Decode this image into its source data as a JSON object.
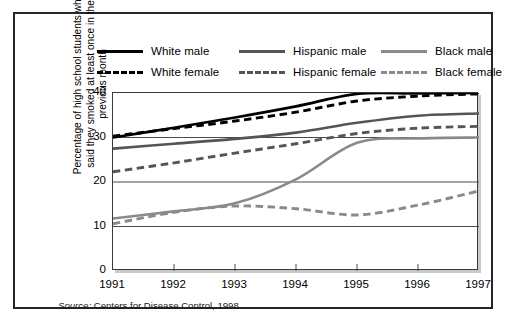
{
  "figure": {
    "source_prefix": "Source:",
    "source_text": " Centers for Disease Control, 1998."
  },
  "legend": {
    "items": [
      {
        "label": "White male",
        "style": "solid",
        "color": "#000000",
        "col": 1,
        "row": 1
      },
      {
        "label": "White female",
        "style": "dashed",
        "color": "#000000",
        "col": 1,
        "row": 2
      },
      {
        "label": "Hispanic male",
        "style": "solid",
        "color": "#555555",
        "col": 2,
        "row": 1
      },
      {
        "label": "Hispanic female",
        "style": "dashed",
        "color": "#555555",
        "col": 2,
        "row": 2
      },
      {
        "label": "Black male",
        "style": "solid",
        "color": "#8a8a8a",
        "col": 3,
        "row": 1
      },
      {
        "label": "Black female",
        "style": "dashed",
        "color": "#8a8a8a",
        "col": 3,
        "row": 2
      }
    ]
  },
  "axes": {
    "ylabel_line1": "Percentage of high school students who",
    "ylabel_line2": "said they smoked at least once in the",
    "ylabel_line3": "previous month",
    "yticks": [
      "0",
      "10",
      "20",
      "30",
      "40"
    ],
    "xticks": [
      "1991",
      "1992",
      "1993",
      "1994",
      "1995",
      "1996",
      "1997"
    ]
  },
  "chart_data": {
    "type": "line",
    "title": "",
    "xlabel": "",
    "ylabel": "Percentage of high school students who said they smoked at least once in the previous month",
    "x": [
      1991,
      1992,
      1993,
      1994,
      1995,
      1996,
      1997
    ],
    "xlim": [
      1991,
      1997
    ],
    "ylim": [
      0,
      40
    ],
    "yticks": [
      0,
      10,
      20,
      30,
      40
    ],
    "grid": "horizontal",
    "legend_position": "top",
    "series": [
      {
        "name": "White male",
        "color": "#000000",
        "style": "solid",
        "values": [
          30.0,
          32.2,
          34.5,
          37.0,
          39.8,
          39.9,
          40.0
        ]
      },
      {
        "name": "White female",
        "color": "#000000",
        "style": "dashed",
        "values": [
          30.3,
          32.0,
          33.7,
          35.7,
          38.2,
          39.3,
          39.8
        ]
      },
      {
        "name": "Hispanic male",
        "color": "#555555",
        "style": "solid",
        "values": [
          27.5,
          28.6,
          29.7,
          31.1,
          33.3,
          34.9,
          35.4
        ]
      },
      {
        "name": "Hispanic female",
        "color": "#555555",
        "style": "dashed",
        "values": [
          22.3,
          24.3,
          26.5,
          28.6,
          30.9,
          32.1,
          32.5
        ]
      },
      {
        "name": "Black male",
        "color": "#8a8a8a",
        "style": "solid",
        "values": [
          11.8,
          13.4,
          15.2,
          20.6,
          28.8,
          29.8,
          30.0
        ]
      },
      {
        "name": "Black female",
        "color": "#8a8a8a",
        "style": "dashed",
        "values": [
          10.6,
          13.2,
          14.6,
          14.0,
          12.6,
          14.8,
          18.0
        ]
      }
    ],
    "source": "Source: Centers for Disease Control, 1998."
  }
}
